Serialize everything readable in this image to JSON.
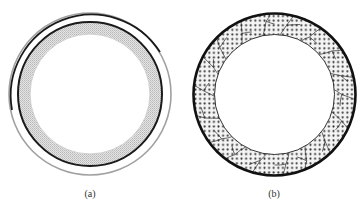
{
  "figure": {
    "panels": [
      {
        "id": "a",
        "label": "(a)",
        "description": "Concentric rings: outer thin gray ring, dark ring, gray shaded annular band, white interior",
        "center": [
          90,
          94
        ],
        "outer_ring_radius": 81,
        "dark_ring_radius": 72,
        "inner_radius": 60
      },
      {
        "id": "b",
        "label": "(b)",
        "description": "Thick dark outer ring with dotted annular band subdivided by grain-boundary lines, white interior",
        "center": [
          274.5,
          94.5
        ],
        "outer_radius": 81,
        "inner_radius": 60,
        "grain_count": 18
      }
    ],
    "colors": {
      "background": "#ffffff",
      "dark_line": "#1a1a1a",
      "light_ring": "#9a9a9a",
      "shade": "#cfcfcf",
      "dot": "#333333",
      "label": "#333333"
    }
  }
}
